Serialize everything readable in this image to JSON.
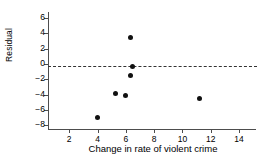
{
  "chart_data": {
    "type": "scatter",
    "title": "",
    "xlabel": "Change in rate of violent crime",
    "ylabel": "Residual",
    "xlim": [
      0.5,
      15.2
    ],
    "ylim": [
      -8.6,
      6.8
    ],
    "xticks": [
      2,
      4,
      6,
      8,
      10,
      12,
      14
    ],
    "yticks": [
      6,
      4,
      2,
      0,
      -2,
      -4,
      -6,
      -8
    ],
    "grid": false,
    "legend": null,
    "marker_color": "#111111",
    "axis_color": "#4d4d4d",
    "points": [
      {
        "x": 4.0,
        "y": -7.0
      },
      {
        "x": 5.3,
        "y": -3.85
      },
      {
        "x": 6.0,
        "y": -4.15
      },
      {
        "x": 6.3,
        "y": 3.5
      },
      {
        "x": 6.5,
        "y": -0.35
      },
      {
        "x": 6.3,
        "y": -1.45
      },
      {
        "x": 11.2,
        "y": -4.5
      }
    ],
    "reference_line": {
      "orientation": "horizontal",
      "value": -0.3,
      "style": "dashed",
      "color": "#333333"
    }
  },
  "axes": {
    "y_title": "Residual",
    "x_title": "Change in rate of violent crime",
    "y_tick_labels": [
      "6",
      "4",
      "2",
      "0",
      "−2",
      "−4",
      "−6",
      "−8"
    ],
    "x_tick_labels": [
      "2",
      "4",
      "6",
      "8",
      "10",
      "12",
      "14"
    ]
  }
}
